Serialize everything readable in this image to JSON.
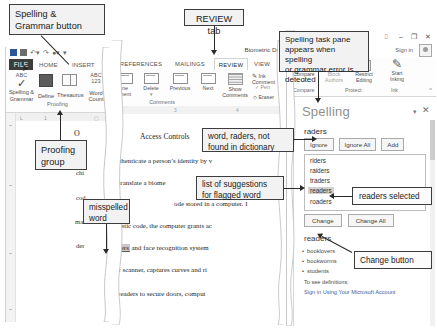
{
  "annotations": {
    "spelling_grammar_button": "Spelling &\nGrammar button",
    "proofing_group": "Proofing\ngroup",
    "review_tab": "REVIEW tab",
    "word_not_found": "word, raders, not\nfound in dictionary",
    "list_of_suggestions": "list of suggestions\nfor flagged word",
    "misspelled_word": "misspelled\nword",
    "task_pane_note": "Spelling task pane\nappears when spelling\nor grammar error is\ndetected",
    "readers_selected": "readers selected",
    "change_button": "Change button"
  },
  "left_window": {
    "file_tab": "FILE",
    "tabs": [
      "HOME",
      "INSERT"
    ],
    "ribbon_items": [
      {
        "label": "Spelling &\nGrammar",
        "icon": "abc-check-icon",
        "top_text": "ABC"
      },
      {
        "label": "Define",
        "icon": "define-icon"
      },
      {
        "label": "Thesaurus",
        "icon": "thesaurus-book-icon"
      },
      {
        "label": "Word\nCount",
        "icon": "word-count-icon",
        "top_text": "ABC\n123"
      }
    ],
    "group_label": "Proofing",
    "ruler_ticks": [
      "L",
      "1"
    ],
    "doc_lines": [
      "O",
      "chi",
      "cod",
      "ma",
      "der"
    ]
  },
  "mid_window": {
    "title_right": "Biometric De",
    "tabs": [
      "REFERENCES",
      "MAILINGS",
      "REVIEW",
      "VIEW"
    ],
    "active_tab": "REVIEW",
    "ribbon_items": [
      {
        "label": "ne\nment",
        "icon": "new-comment-icon"
      },
      {
        "label": "Delete",
        "icon": "delete-comment-icon"
      },
      {
        "label": "Previous",
        "icon": "previous-comment-icon"
      },
      {
        "label": "Next",
        "icon": "next-comment-icon"
      },
      {
        "label": "Show\nComments",
        "icon": "show-comments-icon"
      }
    ],
    "ink_items": [
      "Ink Comment",
      "Pen",
      "Eraser"
    ],
    "group_label": "Comments",
    "ruler_ticks": [
      "2",
      "3",
      "4"
    ],
    "doc_heading": "Access Controls",
    "doc_lines": [
      "nes authenticate a person’s identity by v",
      "ices translate a biome",
      "ode stored in a computer. I",
      "racteristic code, the computer grants ac",
      "int raders and face recognition system",
      "ader, or scanner, captures curves and ri",
      "erprint readers to secure doors, comput"
    ],
    "misspelled_word": "raders"
  },
  "right_window": {
    "window_controls": [
      "⌷",
      "–",
      "❐",
      "✕"
    ],
    "sign_in": "Sign in",
    "ribbon_items": [
      {
        "label": "Compare",
        "icon": "compare-icon"
      },
      {
        "label": "Block\nAuthors",
        "icon": "block-authors-icon"
      },
      {
        "label": "Restrict\nEditing",
        "icon": "restrict-editing-icon"
      },
      {
        "label": "Start\nInking",
        "icon": "start-inking-pen-icon"
      }
    ],
    "group_labels": [
      "Compare",
      "Protect",
      "Ink"
    ],
    "pane": {
      "title": "Spelling",
      "flagged_word": "raders",
      "buttons": [
        "Ignore",
        "Ignore All",
        "Add"
      ],
      "suggestions": [
        "riders",
        "raiders",
        "traders",
        "readers",
        "roaders"
      ],
      "selected_suggestion": "readers",
      "change_buttons": [
        "Change",
        "Change All"
      ],
      "synonym_heading": "readers",
      "synonyms": [
        "booklovers",
        "bookworms",
        "students"
      ],
      "definition_note": "To see definitions:",
      "sign_in_link": "Sign in Using Your Microsoft Account"
    }
  }
}
